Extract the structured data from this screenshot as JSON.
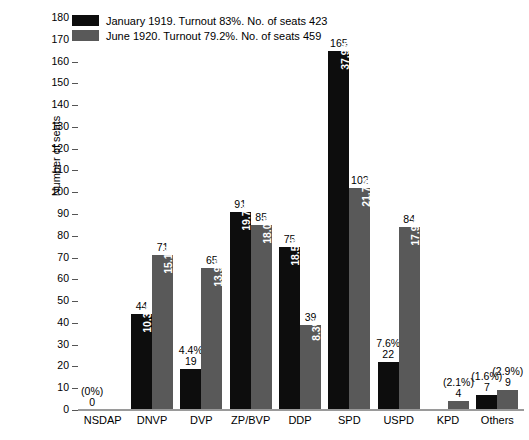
{
  "chart_data": {
    "type": "bar",
    "title": "",
    "xlabel": "",
    "ylabel": "Number of seats",
    "ylim": [
      0,
      180
    ],
    "ytick_step": 10,
    "yticks": [
      180,
      170,
      160,
      150,
      140,
      130,
      120,
      110,
      100,
      90,
      80,
      70,
      60,
      50,
      40,
      30,
      20,
      10,
      0
    ],
    "grid": false,
    "legend_position": "top-left",
    "categories": [
      "NSDAP",
      "DNVP",
      "DVP",
      "ZP/BVP",
      "DDP",
      "SPD",
      "USPD",
      "KPD",
      "Others"
    ],
    "series": [
      {
        "name": "January 1919. Turnout 83%. No. of seats 423",
        "color": "#0d0d0d",
        "values": [
          0,
          44,
          19,
          91,
          75,
          165,
          22,
          null,
          7
        ],
        "pct_labels": [
          "(0%)",
          "10.3%",
          "4.4%",
          "19.7%",
          "18.5%",
          "37.9%",
          "7.6%",
          "",
          "(1.6%)"
        ],
        "value_labels": [
          "0",
          "44",
          "19",
          "91",
          "75",
          "165",
          "22",
          "",
          "7"
        ]
      },
      {
        "name": "June 1920. Turnout 79.2%. No. of seats 459",
        "color": "#595959",
        "values": [
          0,
          71,
          65,
          85,
          39,
          102,
          84,
          4,
          9
        ],
        "pct_labels": [
          "",
          "15.1%",
          "13.9%",
          "18.0%",
          "8.3%",
          "21.7%",
          "17.9%",
          "(2.1%)",
          "(2.9%)"
        ],
        "value_labels": [
          "",
          "71",
          "65",
          "85",
          "39",
          "102",
          "84",
          "4",
          "9"
        ]
      }
    ]
  },
  "legend": {
    "items": [
      {
        "label": "January 1919. Turnout 83%. No. of seats 423",
        "color": "#0d0d0d"
      },
      {
        "label": "June 1920. Turnout 79.2%. No. of seats 459",
        "color": "#595959"
      }
    ]
  },
  "axes": {
    "y_title": "Number of seats"
  }
}
